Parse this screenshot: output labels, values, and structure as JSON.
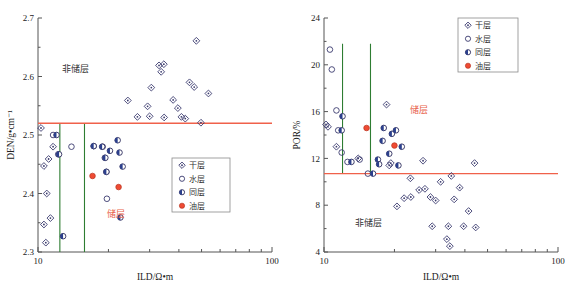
{
  "figure": {
    "layout": "two-panel-scatter",
    "panels": 2
  },
  "legend": {
    "items": [
      {
        "key": "dry",
        "label": "干层",
        "marker": "diamond-open-dot"
      },
      {
        "key": "water",
        "label": "水层",
        "marker": "circle-open"
      },
      {
        "key": "mix",
        "label": "同层",
        "marker": "circle-half-filled"
      },
      {
        "key": "oil",
        "label": "油层",
        "marker": "circle-filled-red"
      }
    ]
  },
  "annotations": {
    "non_reservoir": "非储层",
    "reservoir": "储层"
  },
  "colors": {
    "cutoff_horizontal": "#f0614a",
    "cutoff_vertical": "#2e7d32",
    "reservoir_label": "#e8624a",
    "oil_marker": "#ef4b33",
    "mix_marker": "#2b3f8c",
    "open_marker": "#3a3a6e",
    "axis": "#555555"
  },
  "chart_data": [
    {
      "id": "den-vs-ild",
      "type": "scatter",
      "title": "",
      "xlabel": "ILD/Ω•m",
      "ylabel": "DEN/g•cm⁻¹",
      "xscale": "log",
      "xlim": [
        10,
        100
      ],
      "ylim": [
        2.3,
        2.7
      ],
      "xticks": [
        10,
        100
      ],
      "xticklabels": [
        "10",
        "100"
      ],
      "yticks": [
        2.3,
        2.4,
        2.5,
        2.6,
        2.7
      ],
      "yticklabels": [
        "2.3",
        "2.4",
        "2.5",
        "2.6",
        "2.7"
      ],
      "grid": false,
      "legend_position": "lower-right",
      "cutoffs": {
        "horizontal": {
          "value": 2.52,
          "color": "#f0614a"
        },
        "vertical": [
          {
            "value": 12.4,
            "color": "#2e7d32",
            "y_range": [
              2.3,
              2.52
            ]
          },
          {
            "value": 15.8,
            "color": "#2e7d32",
            "y_range": [
              2.3,
              2.52
            ]
          }
        ]
      },
      "annotations": [
        {
          "text": "非储层",
          "x": 14.5,
          "y": 2.607,
          "color": "#333333"
        },
        {
          "text": "储层",
          "x": 21.5,
          "y": 2.36,
          "color": "#e8624a"
        }
      ],
      "series": [
        {
          "name": "干层",
          "key": "dry",
          "points": [
            [
              10.3,
              2.512
            ],
            [
              10.6,
              2.447
            ],
            [
              11.1,
              2.459
            ],
            [
              10.9,
              2.4
            ],
            [
              11.6,
              2.48
            ],
            [
              11.3,
              2.358
            ],
            [
              10.6,
              2.347
            ],
            [
              10.8,
              2.316
            ],
            [
              24.2,
              2.559
            ],
            [
              29.4,
              2.549
            ],
            [
              30.5,
              2.581
            ],
            [
              32.9,
              2.619
            ],
            [
              34.5,
              2.621
            ],
            [
              33.6,
              2.608
            ],
            [
              37.8,
              2.56
            ],
            [
              39.6,
              2.546
            ],
            [
              41.0,
              2.531
            ],
            [
              42.6,
              2.528
            ],
            [
              44.4,
              2.59
            ],
            [
              46.5,
              2.582
            ],
            [
              49.7,
              2.521
            ],
            [
              53.5,
              2.571
            ],
            [
              47.5,
              2.661
            ],
            [
              26.6,
              2.531
            ],
            [
              30.0,
              2.532
            ],
            [
              34.6,
              2.53
            ]
          ]
        },
        {
          "name": "水层",
          "key": "water",
          "points": [
            [
              11.6,
              2.5
            ],
            [
              13.9,
              2.48
            ],
            [
              17.3,
              2.481
            ],
            [
              18.9,
              2.48
            ],
            [
              19.3,
              2.461
            ],
            [
              19.6,
              2.437
            ],
            [
              19.7,
              2.391
            ],
            [
              12.2,
              2.467
            ]
          ]
        },
        {
          "name": "同层",
          "key": "mix",
          "points": [
            [
              12.0,
              2.5
            ],
            [
              12.3,
              2.467
            ],
            [
              17.3,
              2.481
            ],
            [
              18.8,
              2.48
            ],
            [
              20.3,
              2.473
            ],
            [
              21.9,
              2.491
            ],
            [
              22.3,
              2.47
            ],
            [
              23.0,
              2.446
            ],
            [
              19.4,
              2.461
            ],
            [
              19.6,
              2.437
            ],
            [
              12.8,
              2.327
            ],
            [
              22.5,
              2.359
            ]
          ]
        },
        {
          "name": "油层",
          "key": "oil",
          "points": [
            [
              17.1,
              2.43
            ],
            [
              22.1,
              2.411
            ]
          ]
        }
      ]
    },
    {
      "id": "por-vs-ild",
      "type": "scatter",
      "title": "",
      "xlabel": "ILD/Ω•m",
      "ylabel": "POR/%",
      "xscale": "log",
      "xlim": [
        10,
        100
      ],
      "ylim": [
        4,
        24
      ],
      "xticks": [
        10,
        100
      ],
      "xticklabels": [
        "10",
        "100"
      ],
      "yticks": [
        4,
        8,
        12,
        16,
        20,
        24
      ],
      "yticklabels": [
        "4",
        "8",
        "12",
        "16",
        "20",
        "24"
      ],
      "grid": false,
      "legend_position": "upper-right",
      "cutoffs": {
        "horizontal": {
          "value": 10.7,
          "color": "#f0614a"
        },
        "vertical": [
          {
            "value": 12.0,
            "color": "#2e7d32",
            "y_range": [
              10.7,
              21.8
            ]
          },
          {
            "value": 15.8,
            "color": "#2e7d32",
            "y_range": [
              10.7,
              21.8
            ]
          }
        ]
      },
      "annotations": [
        {
          "text": "储层",
          "x": 25.5,
          "y": 15.9,
          "color": "#e8624a"
        },
        {
          "text": "非储层",
          "x": 15.5,
          "y": 6.2,
          "color": "#333333"
        }
      ],
      "series": [
        {
          "name": "干层",
          "key": "dry",
          "points": [
            [
              10.2,
              14.9
            ],
            [
              10.4,
              14.7
            ],
            [
              11.3,
              13.0
            ],
            [
              14.0,
              12.0
            ],
            [
              18.5,
              16.6
            ],
            [
              19.3,
              11.6
            ],
            [
              19.0,
              11.4
            ],
            [
              26.5,
              11.8
            ],
            [
              23.4,
              10.3
            ],
            [
              31.5,
              10.0
            ],
            [
              35.0,
              10.5
            ],
            [
              38.0,
              9.5
            ],
            [
              44.0,
              11.6
            ],
            [
              27.0,
              9.4
            ],
            [
              25.5,
              9.3
            ],
            [
              28.5,
              8.7
            ],
            [
              23.5,
              8.7
            ],
            [
              22.0,
              8.6
            ],
            [
              20.5,
              7.9
            ],
            [
              30.0,
              8.4
            ],
            [
              36.0,
              8.5
            ],
            [
              41.5,
              7.5
            ],
            [
              34.0,
              6.2
            ],
            [
              39.5,
              6.2
            ],
            [
              44.5,
              6.1
            ],
            [
              33.5,
              5.1
            ],
            [
              34.5,
              4.5
            ],
            [
              29.0,
              6.2
            ]
          ]
        },
        {
          "name": "水层",
          "key": "water",
          "points": [
            [
              10.6,
              21.3
            ],
            [
              10.8,
              19.6
            ],
            [
              11.3,
              16.1
            ],
            [
              11.9,
              12.5
            ],
            [
              12.6,
              11.7
            ],
            [
              14.2,
              11.9
            ],
            [
              15.4,
              10.7
            ],
            [
              11.5,
              14.4
            ]
          ]
        },
        {
          "name": "同层",
          "key": "mix",
          "points": [
            [
              12.0,
              15.6
            ],
            [
              11.9,
              14.4
            ],
            [
              13.1,
              11.7
            ],
            [
              18.0,
              14.6
            ],
            [
              19.5,
              14.1
            ],
            [
              17.8,
              13.5
            ],
            [
              19.0,
              12.4
            ],
            [
              20.8,
              11.4
            ],
            [
              17.0,
              11.9
            ],
            [
              17.2,
              11.5
            ],
            [
              16.2,
              10.7
            ],
            [
              20.3,
              14.4
            ],
            [
              21.5,
              13.0
            ]
          ]
        },
        {
          "name": "油层",
          "key": "oil",
          "points": [
            [
              15.2,
              14.6
            ],
            [
              20.0,
              13.1
            ]
          ]
        }
      ]
    }
  ]
}
